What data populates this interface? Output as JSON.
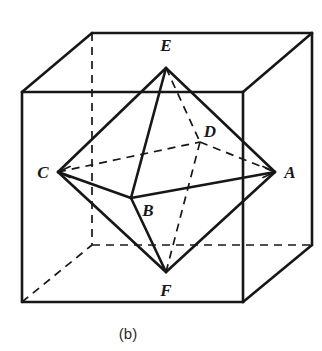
{
  "figure": {
    "caption": "(b)",
    "caption_position": {
      "x": 128,
      "y": 333
    },
    "background_color": "#ffffff",
    "stroke_color": "#17171a",
    "dashed_stroke_color": "#17171a",
    "solid_line_width": 2.6,
    "dashed_line_width": 1.7,
    "dash_pattern": "8,6",
    "width": 322,
    "height": 351
  },
  "cube": {
    "name": "bounding-cube",
    "front_face": {
      "top_left": {
        "x": 22,
        "y": 92
      },
      "top_right": {
        "x": 243,
        "y": 92
      },
      "bottom_right": {
        "x": 243,
        "y": 302
      },
      "bottom_left": {
        "x": 22,
        "y": 302
      }
    },
    "back_face": {
      "top_left": {
        "x": 92,
        "y": 33
      },
      "top_right": {
        "x": 312,
        "y": 33
      },
      "bottom_right": {
        "x": 312,
        "y": 245
      },
      "bottom_left": {
        "x": 92,
        "y": 245
      }
    },
    "visible_edges": [
      {
        "name": "front-top",
        "from": "front.top_left",
        "to": "front.top_right"
      },
      {
        "name": "front-right",
        "from": "front.top_right",
        "to": "front.bottom_right"
      },
      {
        "name": "front-bottom",
        "from": "front.bottom_right",
        "to": "front.bottom_left"
      },
      {
        "name": "front-left",
        "from": "front.bottom_left",
        "to": "front.top_left"
      },
      {
        "name": "back-top",
        "from": "back.top_left",
        "to": "back.top_right"
      },
      {
        "name": "back-right",
        "from": "back.top_right",
        "to": "back.bottom_right"
      },
      {
        "name": "connector-top-left",
        "from": "front.top_left",
        "to": "back.top_left"
      },
      {
        "name": "connector-top-right",
        "from": "front.top_right",
        "to": "back.top_right"
      },
      {
        "name": "connector-bottom-right",
        "from": "front.bottom_right",
        "to": "back.bottom_right"
      }
    ],
    "hidden_edges": [
      {
        "name": "back-left-vertical",
        "from": "back.top_left",
        "to": "back.bottom_left"
      },
      {
        "name": "back-bottom",
        "from": "back.bottom_left",
        "to": "back.bottom_right"
      },
      {
        "name": "connector-bottom-left",
        "from": "front.bottom_left",
        "to": "back.bottom_left"
      }
    ]
  },
  "octahedron": {
    "name": "inscribed-octahedron",
    "vertices": [
      {
        "id": "A",
        "label": "A",
        "x": 275,
        "y": 172,
        "label_x": 290,
        "label_y": 172,
        "position": "right"
      },
      {
        "id": "B",
        "label": "B",
        "x": 131,
        "y": 198,
        "label_x": 148,
        "label_y": 210,
        "position": "front"
      },
      {
        "id": "C",
        "label": "C",
        "x": 58,
        "y": 172,
        "label_x": 43,
        "label_y": 172,
        "position": "left"
      },
      {
        "id": "D",
        "label": "D",
        "x": 200,
        "y": 142,
        "label_x": 210,
        "label_y": 131,
        "position": "back"
      },
      {
        "id": "E",
        "label": "E",
        "x": 166,
        "y": 68,
        "label_x": 166,
        "label_y": 45,
        "position": "top"
      },
      {
        "id": "F",
        "label": "F",
        "x": 166,
        "y": 272,
        "label_x": 166,
        "label_y": 290,
        "position": "bottom"
      }
    ],
    "visible_edges": [
      {
        "name": "edge-E-C",
        "from": "E",
        "to": "C"
      },
      {
        "name": "edge-E-B",
        "from": "E",
        "to": "B"
      },
      {
        "name": "edge-E-A",
        "from": "E",
        "to": "A"
      },
      {
        "name": "edge-F-C",
        "from": "F",
        "to": "C"
      },
      {
        "name": "edge-F-B",
        "from": "F",
        "to": "B"
      },
      {
        "name": "edge-F-A",
        "from": "F",
        "to": "A"
      },
      {
        "name": "edge-C-B",
        "from": "C",
        "to": "B"
      },
      {
        "name": "edge-B-A",
        "from": "B",
        "to": "A"
      }
    ],
    "hidden_edges": [
      {
        "name": "edge-E-D",
        "from": "E",
        "to": "D"
      },
      {
        "name": "edge-F-D",
        "from": "F",
        "to": "D"
      },
      {
        "name": "edge-C-D",
        "from": "C",
        "to": "D"
      },
      {
        "name": "edge-D-A",
        "from": "D",
        "to": "A"
      }
    ],
    "arrowheads": [
      {
        "name": "arrowhead-at-C",
        "at": "C"
      },
      {
        "name": "arrowhead-at-A",
        "at": "A"
      }
    ]
  }
}
